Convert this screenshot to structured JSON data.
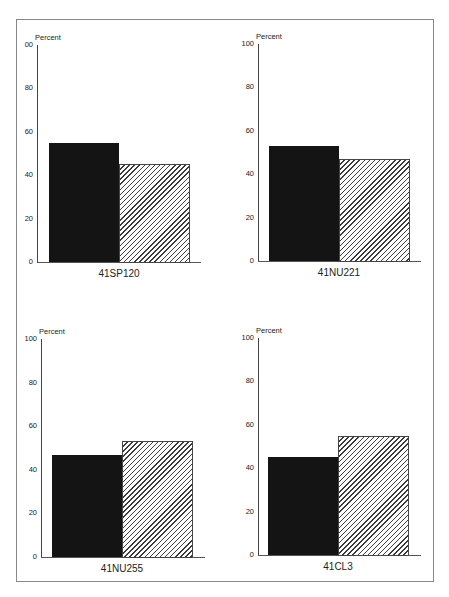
{
  "chart_data": [
    {
      "type": "bar",
      "title": "41SP120",
      "ylabel": "Percent",
      "ylim": [
        0,
        100
      ],
      "yticks": [
        "00",
        "80",
        "60",
        "40",
        "20",
        "0"
      ],
      "series": [
        {
          "name": "solid",
          "values": [
            55
          ]
        },
        {
          "name": "hatched",
          "values": [
            45
          ]
        }
      ],
      "categories": [
        "41SP120"
      ]
    },
    {
      "type": "bar",
      "title": "41NU221",
      "ylabel": "Percent",
      "ylim": [
        0,
        100
      ],
      "yticks": [
        "100",
        "80",
        "60",
        "40",
        "20",
        "0"
      ],
      "series": [
        {
          "name": "solid",
          "values": [
            53
          ]
        },
        {
          "name": "hatched",
          "values": [
            47
          ]
        }
      ],
      "categories": [
        "41NU221"
      ]
    },
    {
      "type": "bar",
      "title": "41NU255",
      "ylabel": "Percent",
      "ylim": [
        0,
        100
      ],
      "yticks": [
        "100",
        "80",
        "60",
        "40",
        "20",
        "0"
      ],
      "series": [
        {
          "name": "solid",
          "values": [
            47
          ]
        },
        {
          "name": "hatched",
          "values": [
            53
          ]
        }
      ],
      "categories": [
        "41NU255"
      ]
    },
    {
      "type": "bar",
      "title": "41CL3",
      "ylabel": "Percent",
      "ylim": [
        0,
        100
      ],
      "yticks": [
        "100",
        "80",
        "60",
        "40",
        "20",
        "0"
      ],
      "series": [
        {
          "name": "solid",
          "values": [
            45
          ]
        },
        {
          "name": "hatched",
          "values": [
            55
          ]
        }
      ],
      "categories": [
        "41CL3"
      ]
    }
  ],
  "panels": [
    {
      "ylabel": "Percent",
      "ticks": [
        "00",
        "80",
        "60",
        "40",
        "20",
        "0"
      ],
      "category": "41SP120",
      "solid": 55,
      "hatched": 45
    },
    {
      "ylabel": "Percent",
      "ticks": [
        "100",
        "80",
        "60",
        "40",
        "20",
        "0"
      ],
      "category": "41NU221",
      "solid": 53,
      "hatched": 47
    },
    {
      "ylabel": "Percent",
      "ticks": [
        "100",
        "80",
        "60",
        "40",
        "20",
        "0"
      ],
      "category": "41NU255",
      "solid": 47,
      "hatched": 53
    },
    {
      "ylabel": "Percent",
      "ticks": [
        "100",
        "80",
        "60",
        "40",
        "20",
        "0"
      ],
      "category": "41CL3",
      "solid": 45,
      "hatched": 55
    }
  ]
}
